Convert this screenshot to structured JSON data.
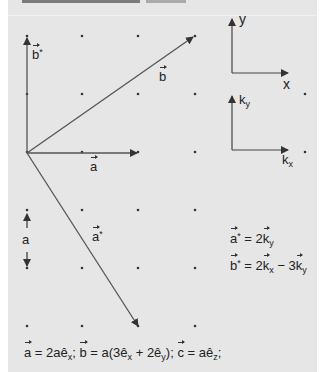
{
  "figure": {
    "background": "#e6e6e6",
    "line_color": "#444444",
    "grid": {
      "columns_x": [
        27,
        82,
        138,
        195
      ],
      "rows_y": [
        36,
        94,
        152,
        210,
        268,
        326
      ],
      "extra_dots": [
        [
          305,
          94
        ],
        [
          305,
          152
        ]
      ]
    },
    "origin": [
      27,
      153
    ],
    "vectors": [
      {
        "name": "a",
        "from": [
          27,
          153
        ],
        "to": [
          138,
          153
        ],
        "label": "a"
      },
      {
        "name": "b",
        "from": [
          27,
          153
        ],
        "to": [
          194,
          36
        ],
        "label": "b"
      },
      {
        "name": "a*",
        "from": [
          27,
          153
        ],
        "to": [
          139,
          327
        ],
        "label": "a",
        "label_sup": "*"
      },
      {
        "name": "b*",
        "from": [
          27,
          153
        ],
        "to": [
          27,
          36
        ],
        "label": "b",
        "label_sup": "*"
      }
    ],
    "scale_marker": {
      "label": "a",
      "top": 211,
      "bottom": 268,
      "x": 27
    },
    "real_axes": {
      "x_label": "x",
      "y_label": "y"
    },
    "reciprocal_axes": {
      "x_label": "k",
      "x_sub": "x",
      "y_label": "k",
      "y_sub": "y"
    }
  },
  "equations": {
    "a_star": {
      "lhs": "a",
      "lhs_sup": "*",
      "rhs_pre": " = 2",
      "k1": "k",
      "k1_sub": "y"
    },
    "b_star": {
      "lhs": "b",
      "lhs_sup": "*",
      "rhs_pre": " = 2",
      "k1": "k",
      "k1_sub": "x",
      "mid": " − 3",
      "k2": "k",
      "k2_sub": "y"
    },
    "definitions": {
      "a": "a",
      "a_eq": " = 2aê",
      "a_sub": "x",
      "sep1": "; ",
      "b": "b",
      "b_eq": " = a(3ê",
      "b_sub1": "x",
      "b_mid": " + 2ê",
      "b_sub2": "y",
      "b_close": "); ",
      "c": "c",
      "c_eq": " = aê",
      "c_sub": "z",
      "end": ";"
    }
  }
}
